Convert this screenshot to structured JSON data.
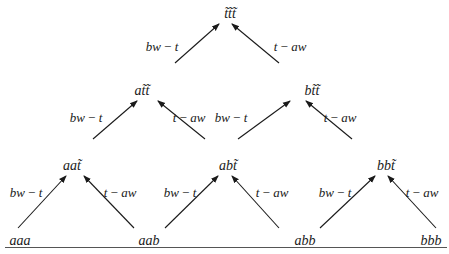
{
  "diagram": {
    "type": "lattice",
    "nodes": [
      {
        "id": "ttt",
        "label": "t̃t̃t̃",
        "x": 230,
        "y": 14
      },
      {
        "id": "att",
        "label": "at̃t̃",
        "x": 142,
        "y": 91
      },
      {
        "id": "btt",
        "label": "bt̃t̃",
        "x": 312,
        "y": 91
      },
      {
        "id": "aat",
        "label": "aat̃",
        "x": 72,
        "y": 166
      },
      {
        "id": "abt",
        "label": "abt̃",
        "x": 228,
        "y": 166
      },
      {
        "id": "bbt",
        "label": "bbt̃",
        "x": 386,
        "y": 166
      },
      {
        "id": "aaa",
        "label": "aaa",
        "x": 20,
        "y": 241
      },
      {
        "id": "aab",
        "label": "aab",
        "x": 149,
        "y": 241
      },
      {
        "id": "abb",
        "label": "abb",
        "x": 305,
        "y": 241
      },
      {
        "id": "bbb",
        "label": "bbb",
        "x": 431,
        "y": 241
      }
    ],
    "edges": [
      {
        "from": "att",
        "to": "ttt",
        "label": "bw − t",
        "x1": 175,
        "y1": 63,
        "x2": 219,
        "y2": 24,
        "lx": 162,
        "ly": 46
      },
      {
        "from": "btt",
        "to": "ttt",
        "label": "t − aw",
        "x1": 279,
        "y1": 63,
        "x2": 232,
        "y2": 24,
        "lx": 290,
        "ly": 46
      },
      {
        "from": "aat",
        "to": "att",
        "label": "bw − t",
        "x1": 93,
        "y1": 139,
        "x2": 137,
        "y2": 101,
        "lx": 86,
        "ly": 117
      },
      {
        "from": "abt",
        "to": "att",
        "label": "t − aw",
        "x1": 205,
        "y1": 139,
        "x2": 158,
        "y2": 101,
        "lx": 189,
        "ly": 117
      },
      {
        "from": "abt",
        "to": "btt",
        "label": "bw − t",
        "x1": 238,
        "y1": 139,
        "x2": 290,
        "y2": 101,
        "lx": 231,
        "ly": 117
      },
      {
        "from": "bbt",
        "to": "btt",
        "label": "t − aw",
        "x1": 352,
        "y1": 139,
        "x2": 306,
        "y2": 101,
        "lx": 340,
        "ly": 117
      },
      {
        "from": "aaa",
        "to": "aat",
        "label": "bw − t",
        "x1": 18,
        "y1": 228,
        "x2": 66,
        "y2": 176,
        "lx": 26,
        "ly": 192
      },
      {
        "from": "aab",
        "to": "aat",
        "label": "t − aw",
        "x1": 134,
        "y1": 228,
        "x2": 84,
        "y2": 176,
        "lx": 120,
        "ly": 192
      },
      {
        "from": "aab",
        "to": "abt",
        "label": "bw − t",
        "x1": 165,
        "y1": 228,
        "x2": 218,
        "y2": 176,
        "lx": 180,
        "ly": 192
      },
      {
        "from": "abb",
        "to": "abt",
        "label": "t − aw",
        "x1": 279,
        "y1": 228,
        "x2": 232,
        "y2": 176,
        "lx": 272,
        "ly": 192
      },
      {
        "from": "abb",
        "to": "bbt",
        "label": "bw − t",
        "x1": 320,
        "y1": 228,
        "x2": 375,
        "y2": 176,
        "lx": 335,
        "ly": 192
      },
      {
        "from": "bbb",
        "to": "bbt",
        "label": "t − aw",
        "x1": 436,
        "y1": 228,
        "x2": 388,
        "y2": 176,
        "lx": 422,
        "ly": 192
      }
    ]
  },
  "colors": {
    "ink": "#1a1a1a",
    "rule": "#555555",
    "background": "#ffffff"
  }
}
